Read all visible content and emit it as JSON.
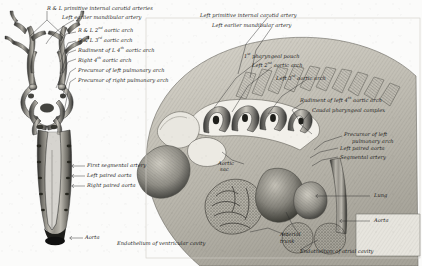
{
  "plate": {
    "domain": "anatomical-illustration",
    "background_color": "#fbfbfa",
    "ink_color": "#1b1b1b",
    "width": 422,
    "height": 266,
    "panels": [
      {
        "id": "left",
        "caption": "wax-reconstruction of paired dorsal aortae, ventral view"
      },
      {
        "id": "right",
        "caption": "sagittal reconstruction of pharyngeal region and heart"
      }
    ]
  },
  "left_panel": {
    "labels": {
      "carotid": "R & L primitive internal carotid arteries",
      "mandibular": "Left earlier mandibular artery",
      "arch2_pre": "R & L 2",
      "arch2_sup": "nd",
      "arch2_post": " aortic arch",
      "arch3_pre": "R & L 3",
      "arch3_sup": "rd",
      "arch3_post": " aortic arch",
      "arch4l_pre": "Rudiment of L 4",
      "arch4l_sup": "th",
      "arch4l_post": " aortic arch",
      "arch4r_pre": "Right 4",
      "arch4r_sup": "th",
      "arch4r_post": " aortic arch",
      "pulm_left": "Precursor of left pulmonary arch",
      "pulm_right": "Precursor of right pulmonary arch",
      "segmental": "First segmental artery",
      "aorta_left": "Left paired aorta",
      "aorta_right": "Right paired aorta",
      "aorta": "Aorta"
    }
  },
  "right_panel": {
    "labels": {
      "carotid_left": "Left primitive internal carotid artery",
      "mandibular_left": "Left earlier mandibular artery",
      "pouch1_pre": "1",
      "pouch1_sup": "st",
      "pouch1_post": " pharyngeal pouch",
      "arch2_pre": "Left 2",
      "arch2_sup": "nd",
      "arch2_post": " aortic arch",
      "arch3_pre": "Left 3",
      "arch3_sup": "rd",
      "arch3_post": " aortic arch",
      "arch4_pre": "Rudiment of left 4",
      "arch4_sup": "th",
      "arch4_post": " aortic arch",
      "caudal": "Caudal pharyngeal complex",
      "pulm_l1": "Precursor of left",
      "pulm_l2": "pulmonary arch",
      "aorta_left": "Left paired aorta",
      "segmental": "Segmental artery",
      "aortic_sac_l1": "Aortic",
      "aortic_sac_l2": "sac",
      "lung": "Lung",
      "aorta": "Aorta",
      "trunk_l1": "Arterial",
      "trunk_l2": "trunk",
      "endo_ventricular": "Endothelium of ventricular cavity",
      "endo_atrial": "Endothelium of atrial cavity"
    }
  }
}
